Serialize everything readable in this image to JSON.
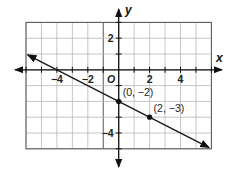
{
  "chart_data": {
    "type": "line",
    "title": "",
    "xlabel": "x",
    "ylabel": "y",
    "origin_label": "O",
    "xlim": [
      -6,
      6
    ],
    "ylim": [
      -5,
      3
    ],
    "grid": true,
    "x_ticks": [
      {
        "value": -4,
        "label": "−4"
      },
      {
        "value": -2,
        "label": "−2"
      },
      {
        "value": 2,
        "label": "2"
      },
      {
        "value": 4,
        "label": "4"
      }
    ],
    "y_ticks": [
      {
        "value": 2,
        "label": "2"
      },
      {
        "value": -4,
        "label": "−4"
      }
    ],
    "series": [
      {
        "name": "line",
        "equation": "y = -1/2 x - 2",
        "slope": -0.5,
        "intercept": -2,
        "x_range": [
          -5.9,
          5.85
        ],
        "arrows": "both",
        "color": "#1a1a1a"
      }
    ],
    "points": [
      {
        "x": 0,
        "y": -2,
        "label": "(0, −2)"
      },
      {
        "x": 2,
        "y": -3,
        "label": "(2, −3)"
      }
    ],
    "x_intercept": -4
  }
}
